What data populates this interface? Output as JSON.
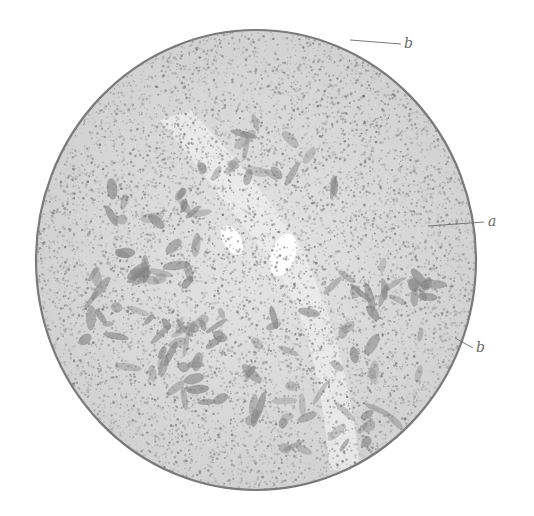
{
  "figure": {
    "background_color": "#ffffff",
    "tissue_color": "#a8a8a8",
    "border_color": "#7a7a7a",
    "circle": {
      "cx": 256,
      "cy": 260,
      "rx": 220,
      "ry": 230
    }
  },
  "labels": [
    {
      "id": "label-b-top",
      "text": "b",
      "x": 404,
      "y": 36,
      "leader": {
        "x1": 350,
        "y1": 40,
        "x2": 401,
        "y2": 44
      }
    },
    {
      "id": "label-a",
      "text": "a",
      "x": 488,
      "y": 214,
      "leader": {
        "x1": 428,
        "y1": 226,
        "x2": 484,
        "y2": 222
      }
    },
    {
      "id": "label-b-bottom",
      "text": "b",
      "x": 476,
      "y": 340,
      "leader": {
        "x1": 455,
        "y1": 338,
        "x2": 473,
        "y2": 348
      }
    }
  ]
}
